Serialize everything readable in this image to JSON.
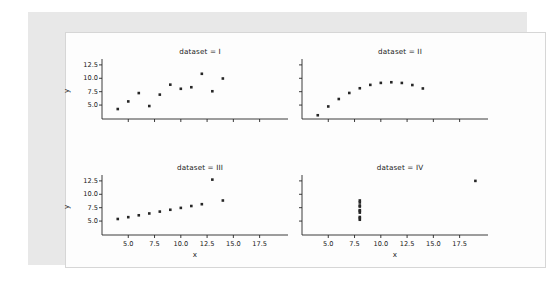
{
  "figure": {
    "background_color": "#fdfdfd",
    "surface_color": "#e8e8e8",
    "border_color": "#d6d6d6",
    "marker_color": "#262626",
    "axis_color": "#262626"
  },
  "chart_data": {
    "type": "scatter",
    "title": "",
    "xlabel": "x",
    "ylabel": "y",
    "xlim": [
      2.5,
      20.2
    ],
    "ylim": [
      2.4,
      13.6
    ],
    "xticks": [
      5.0,
      7.5,
      10.0,
      12.5,
      15.0,
      17.5
    ],
    "xtick_labels": [
      "5.0",
      "7.5",
      "10.0",
      "12.5",
      "15.0",
      "17.5"
    ],
    "yticks": [
      5.0,
      7.5,
      10.0,
      12.5
    ],
    "ytick_labels": [
      "5.0",
      "7.5",
      "10.0",
      "12.5"
    ],
    "grid": false,
    "legend": false,
    "facets": [
      {
        "title": "dataset = I",
        "name": "I",
        "x": [
          10.0,
          8.0,
          13.0,
          9.0,
          11.0,
          14.0,
          6.0,
          4.0,
          12.0,
          7.0,
          5.0
        ],
        "y": [
          8.04,
          6.95,
          7.58,
          8.81,
          8.33,
          9.96,
          7.24,
          4.26,
          10.84,
          4.82,
          5.68
        ]
      },
      {
        "title": "dataset = II",
        "name": "II",
        "x": [
          10.0,
          8.0,
          13.0,
          9.0,
          11.0,
          14.0,
          6.0,
          4.0,
          12.0,
          7.0,
          5.0
        ],
        "y": [
          9.14,
          8.14,
          8.74,
          8.77,
          9.26,
          8.1,
          6.13,
          3.1,
          9.13,
          7.26,
          4.74
        ]
      },
      {
        "title": "dataset = III",
        "name": "III",
        "x": [
          10.0,
          8.0,
          13.0,
          9.0,
          11.0,
          14.0,
          6.0,
          4.0,
          12.0,
          7.0,
          5.0
        ],
        "y": [
          7.46,
          6.77,
          12.74,
          7.11,
          7.81,
          8.84,
          6.08,
          5.39,
          8.15,
          6.42,
          5.73
        ]
      },
      {
        "title": "dataset = IV",
        "name": "IV",
        "x": [
          8.0,
          8.0,
          8.0,
          8.0,
          8.0,
          8.0,
          8.0,
          19.0,
          8.0,
          8.0,
          8.0
        ],
        "y": [
          6.58,
          5.76,
          7.71,
          8.84,
          8.47,
          7.04,
          5.25,
          12.5,
          5.56,
          7.91,
          6.89
        ]
      }
    ]
  }
}
